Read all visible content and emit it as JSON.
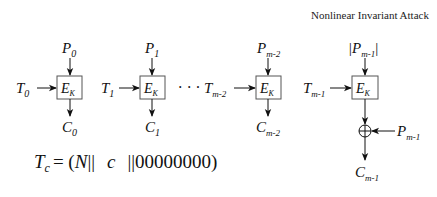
{
  "title": "Nonlinear Invariant Attack",
  "blocks": [
    {
      "tweak": "T",
      "tweak_sub": "0",
      "plain": "P",
      "plain_sub": "0",
      "cipher": "C",
      "cipher_sub": "0",
      "box": "E",
      "box_sub": "K"
    },
    {
      "tweak": "T",
      "tweak_sub": "1",
      "plain": "P",
      "plain_sub": "1",
      "cipher": "C",
      "cipher_sub": "1",
      "box": "E",
      "box_sub": "K"
    },
    {
      "tweak": "T",
      "tweak_sub": "m-2",
      "plain": "P",
      "plain_sub": "m-2",
      "cipher": "C",
      "cipher_sub": "m-2",
      "box": "E",
      "box_sub": "K"
    },
    {
      "tweak": "T",
      "tweak_sub": "m-1",
      "plain": "|P",
      "plain_sub": "m-1",
      "plain_suffix": "|",
      "cipher": "C",
      "cipher_sub": "m-1",
      "box": "E",
      "box_sub": "K",
      "xor_input": "P",
      "xor_input_sub": "m-1"
    }
  ],
  "ellipsis": "· · ·",
  "xor_symbol": "xor-circle",
  "formula": {
    "lhs": "T",
    "lhs_sub": "c",
    "eq": "= (",
    "n": "N",
    "sep1": "||",
    "c": "c",
    "sep2": "||",
    "zeros": "00000000",
    "close": ")"
  }
}
